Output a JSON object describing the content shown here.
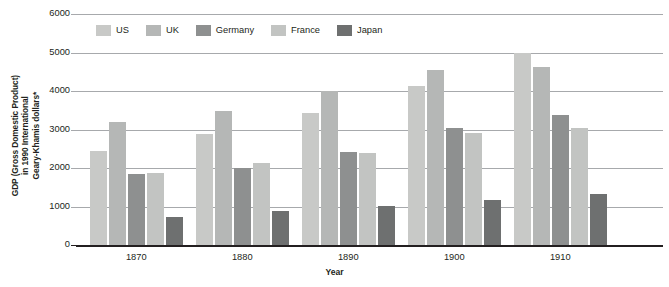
{
  "chart_data": {
    "type": "bar",
    "title": "",
    "subtitle": "",
    "xlabel": "Year",
    "ylabel": "GDP (Gross Domestic Product)\nin 1990 International\nGeary-Khamis dollars*",
    "categories": [
      "1870",
      "1880",
      "1890",
      "1900",
      "1910"
    ],
    "series": [
      {
        "name": "US",
        "color": "#c8c9c7",
        "values": [
          2445,
          2890,
          3420,
          4120,
          4990
        ]
      },
      {
        "name": "UK",
        "color": "#b5b7b6",
        "values": [
          3200,
          3490,
          4000,
          4540,
          4630
        ]
      },
      {
        "name": "Germany",
        "color": "#8e9090",
        "values": [
          1840,
          1990,
          2420,
          3040,
          3390
        ]
      },
      {
        "name": "France",
        "color": "#c2c4c2",
        "values": [
          1880,
          2120,
          2380,
          2910,
          3030
        ]
      },
      {
        "name": "Japan",
        "color": "#6e7070",
        "values": [
          740,
          880,
          1010,
          1180,
          1320
        ]
      }
    ],
    "ylim": [
      0,
      6000
    ],
    "yticks": [
      0,
      1000,
      2000,
      3000,
      4000,
      5000,
      6000
    ],
    "ytick_labels": [
      "0",
      "1000",
      "2000",
      "3000",
      "4000",
      "5000",
      "6000"
    ],
    "grid": true,
    "legend_position": "top-left-inside",
    "axis_color": "#231f20",
    "grid_color": "#a7a9ac",
    "background": "#ffffff"
  }
}
